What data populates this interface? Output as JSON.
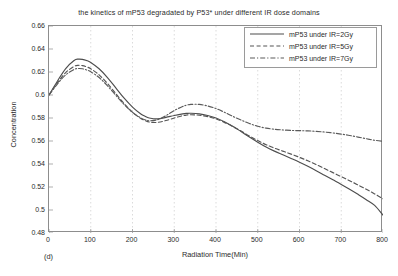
{
  "chart_data": {
    "type": "line",
    "title": "the kinetics of mP53 degradated by P53* under different IR dose domains",
    "xlabel": "Radiation Time(Min)",
    "ylabel": "Concentration",
    "subfigure_label": "(d)",
    "xlim": [
      0,
      800
    ],
    "ylim": [
      0.48,
      0.66
    ],
    "xticks": [
      0,
      100,
      200,
      300,
      400,
      500,
      600,
      700,
      800
    ],
    "yticks": [
      0.48,
      0.5,
      0.52,
      0.54,
      0.56,
      0.58,
      0.6,
      0.62,
      0.64,
      0.66
    ],
    "xtick_labels": [
      "0",
      "100",
      "200",
      "300",
      "400",
      "500",
      "600",
      "700",
      "800"
    ],
    "ytick_labels": [
      "0.48",
      "0.5",
      "0.52",
      "0.54",
      "0.56",
      "0.58",
      "0.6",
      "0.62",
      "0.64",
      "0.66"
    ],
    "grid": "vertical-dotted",
    "legend_position": "top-right",
    "x": [
      0,
      20,
      40,
      60,
      70,
      80,
      90,
      100,
      120,
      140,
      160,
      180,
      200,
      220,
      230,
      240,
      260,
      280,
      300,
      320,
      330,
      340,
      360,
      380,
      400,
      420,
      440,
      460,
      480,
      500,
      520,
      540,
      560,
      580,
      600,
      620,
      640,
      660,
      680,
      700,
      720,
      740,
      760,
      780,
      800
    ],
    "series": [
      {
        "name": "mP53 under IR=2Gy",
        "style": "solid",
        "color": "#4d4d4d",
        "values": [
          0.6,
          0.612,
          0.623,
          0.63,
          0.6312,
          0.631,
          0.63,
          0.6283,
          0.6228,
          0.6152,
          0.6062,
          0.5972,
          0.5895,
          0.5835,
          0.5815,
          0.58,
          0.5792,
          0.5805,
          0.5822,
          0.5836,
          0.584,
          0.5841,
          0.5836,
          0.5822,
          0.58,
          0.5768,
          0.5728,
          0.5682,
          0.5635,
          0.559,
          0.5548,
          0.5512,
          0.548,
          0.5448,
          0.5415,
          0.538,
          0.5342,
          0.5302,
          0.5262,
          0.5222,
          0.518,
          0.5136,
          0.509,
          0.504,
          0.4955
        ]
      },
      {
        "name": "mP53  under IR=5Gy",
        "style": "dashed",
        "color": "#555555",
        "values": [
          0.6,
          0.6105,
          0.6195,
          0.6248,
          0.6258,
          0.6255,
          0.6245,
          0.6228,
          0.6175,
          0.61,
          0.6012,
          0.5925,
          0.585,
          0.5795,
          0.5778,
          0.5765,
          0.5762,
          0.5778,
          0.58,
          0.582,
          0.5826,
          0.5828,
          0.5824,
          0.5812,
          0.5792,
          0.5762,
          0.5726,
          0.5686,
          0.5644,
          0.5604,
          0.5568,
          0.5538,
          0.5512,
          0.5486,
          0.5458,
          0.5428,
          0.5395,
          0.536,
          0.5325,
          0.529,
          0.5255,
          0.5218,
          0.518,
          0.514,
          0.5098
        ]
      },
      {
        "name": "mP53  under IR=7Gy",
        "style": "dashdot",
        "color": "#5a5a5a",
        "values": [
          0.6,
          0.6095,
          0.6175,
          0.6222,
          0.623,
          0.6228,
          0.6218,
          0.6202,
          0.6152,
          0.608,
          0.5998,
          0.5918,
          0.585,
          0.58,
          0.5785,
          0.5776,
          0.5785,
          0.582,
          0.5865,
          0.59,
          0.5912,
          0.5918,
          0.5918,
          0.5905,
          0.5882,
          0.585,
          0.5815,
          0.5782,
          0.5752,
          0.5728,
          0.5712,
          0.5702,
          0.5696,
          0.5692,
          0.569,
          0.5688,
          0.5684,
          0.5678,
          0.567,
          0.566,
          0.5648,
          0.5634,
          0.562,
          0.5606,
          0.5598
        ]
      }
    ]
  }
}
